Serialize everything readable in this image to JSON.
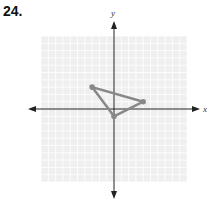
{
  "problem": {
    "number": "24."
  },
  "graph": {
    "x_label": "x",
    "y_label": "y",
    "x_range": [
      -10,
      10
    ],
    "y_range": [
      -10,
      10
    ],
    "grid": true,
    "grid_color": "#e3e3e3",
    "grid_bg": "#efefef",
    "axis_color": "#222222",
    "shape_color": "#888888"
  },
  "shape": {
    "type": "triangle",
    "vertices": [
      {
        "x": -3,
        "y": 3
      },
      {
        "x": 4,
        "y": 1
      },
      {
        "x": 0,
        "y": -1
      }
    ]
  }
}
